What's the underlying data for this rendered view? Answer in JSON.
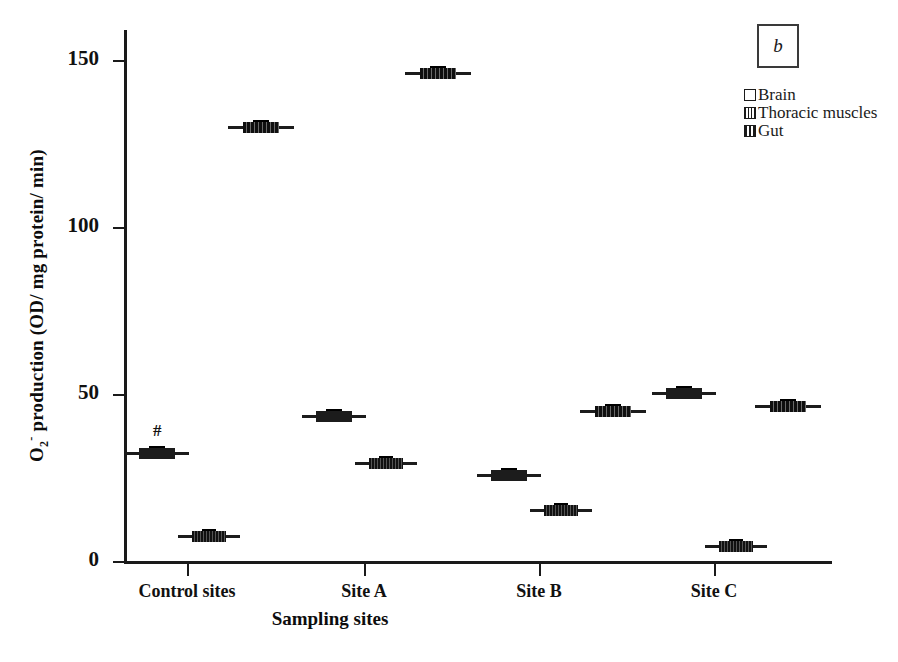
{
  "panel": {
    "letter": "b"
  },
  "axes": {
    "ylabel_html": "O2- production (OD/ mg protein/ min)",
    "xlabel": "Sampling sites",
    "yticks": [
      "0",
      "50",
      "100",
      "150"
    ],
    "xticks": [
      "Control sites",
      "Site A",
      "Site B",
      "Site C"
    ]
  },
  "legend": {
    "items": [
      {
        "label": "Brain",
        "pattern": "empty"
      },
      {
        "label": "Thoracic muscles",
        "pattern": "hatch"
      },
      {
        "label": "Gut",
        "pattern": "vlines"
      }
    ]
  },
  "annotations": [
    {
      "text": "#",
      "group": "Control sites",
      "series": "Brain"
    }
  ],
  "chart_data": {
    "type": "bar",
    "plot_style": "boxplot",
    "title": "",
    "subtitle": "",
    "xlabel": "Sampling sites",
    "ylabel": "O2- production (OD/ mg protein/ min)",
    "categories": [
      "Control sites",
      "Site A",
      "Site B",
      "Site C"
    ],
    "ylim": [
      0,
      160
    ],
    "yticks": [
      0,
      50,
      100,
      150
    ],
    "grid": false,
    "legend_position": "top-right",
    "annotations": [
      {
        "text": "#",
        "category": "Control sites",
        "series": "Brain",
        "value": 33
      }
    ],
    "series": [
      {
        "name": "Brain",
        "values": [
          33,
          44,
          26.5,
          51
        ]
      },
      {
        "name": "Thoracic muscles",
        "values": [
          8,
          30,
          16,
          5
        ]
      },
      {
        "name": "Gut",
        "values": [
          131,
          147,
          45.5,
          47
        ]
      }
    ]
  }
}
